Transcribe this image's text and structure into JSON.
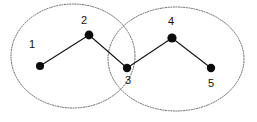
{
  "figure": {
    "canvas": {
      "width": 257,
      "height": 122,
      "background": "#ffffff"
    },
    "colors": {
      "node_fill": "#0b0b0b",
      "edge_stroke": "#111111",
      "cluster_stroke": "#555555",
      "label_color": "#111111"
    }
  },
  "chart_data": {
    "type": "diagram",
    "title": "",
    "xlabel": "",
    "ylabel": "",
    "graph": {
      "kind": "undirected-path",
      "node_count": 5,
      "edge_count": 4,
      "nodes": [
        {
          "id": "1",
          "label": "1",
          "x": 40,
          "y": 66,
          "r": 4.0,
          "label_x": 32,
          "label_y": 45
        },
        {
          "id": "2",
          "label": "2",
          "x": 89,
          "y": 35,
          "r": 4.4,
          "label_x": 84,
          "label_y": 21
        },
        {
          "id": "3",
          "label": "3",
          "x": 127,
          "y": 68,
          "r": 4.2,
          "label_x": 128,
          "label_y": 81
        },
        {
          "id": "4",
          "label": "4",
          "x": 172,
          "y": 38,
          "r": 4.6,
          "label_x": 171,
          "label_y": 22
        },
        {
          "id": "5",
          "label": "5",
          "x": 211,
          "y": 68,
          "r": 4.2,
          "label_x": 211,
          "label_y": 84
        }
      ],
      "edges": [
        {
          "from": "1",
          "to": "2"
        },
        {
          "from": "2",
          "to": "3"
        },
        {
          "from": "3",
          "to": "4"
        },
        {
          "from": "4",
          "to": "5"
        }
      ]
    },
    "clusters": [
      {
        "id": "left-cluster",
        "name": "left-cluster",
        "members": [
          "1",
          "2",
          "3"
        ],
        "shape": "ellipse",
        "cx": 73,
        "cy": 56,
        "rx": 62,
        "ry": 52,
        "stroke": "#555555",
        "style": "dotted"
      },
      {
        "id": "right-cluster",
        "name": "right-cluster",
        "members": [
          "3",
          "4",
          "5"
        ],
        "shape": "ellipse",
        "cx": 176,
        "cy": 59,
        "rx": 68,
        "ry": 52,
        "stroke": "#555555",
        "style": "dotted"
      }
    ],
    "overlap": {
      "shared_nodes": [
        "3"
      ]
    },
    "legend": [],
    "annotations": []
  }
}
